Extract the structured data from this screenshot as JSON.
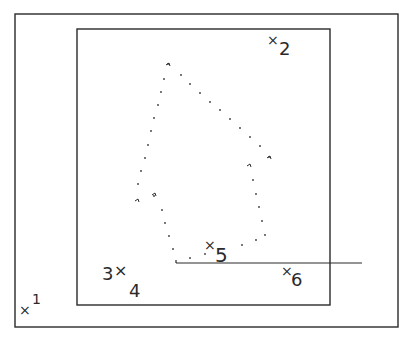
{
  "diagram": {
    "type": "cad-viewport-selection",
    "colors": {
      "line": "#2a2a2a",
      "background": "#ffffff",
      "dots": "#3a3a3a"
    },
    "outer_frame": {
      "x1": 15,
      "y1": 14,
      "x2": 398,
      "y2": 327
    },
    "inner_frame": {
      "x1": 77,
      "y1": 29,
      "x2": 330,
      "y2": 305
    },
    "horizontal_line": {
      "x1": 176,
      "y1": 263,
      "x2": 362,
      "y2": 263
    },
    "points": [
      {
        "id": "1",
        "label": "1",
        "marker": "×",
        "x": 25,
        "y": 310
      },
      {
        "id": "2",
        "label": "2",
        "marker": "×",
        "x": 274,
        "y": 41
      },
      {
        "id": "3",
        "label": "3",
        "marker": "×",
        "x": 120,
        "y": 272
      },
      {
        "id": "4",
        "label": "4",
        "marker": "",
        "x": 137,
        "y": 292
      },
      {
        "id": "5",
        "label": "5",
        "marker": "×",
        "x": 210,
        "y": 246
      },
      {
        "id": "6",
        "label": "6",
        "marker": "×",
        "x": 287,
        "y": 272
      }
    ],
    "dotted_polygon": [
      [
        168,
        64
      ],
      [
        181,
        75
      ],
      [
        190,
        84
      ],
      [
        200,
        93
      ],
      [
        210,
        102
      ],
      [
        220,
        110
      ],
      [
        230,
        119
      ],
      [
        240,
        128
      ],
      [
        250,
        137
      ],
      [
        260,
        146
      ],
      [
        269,
        157
      ],
      [
        164,
        79
      ],
      [
        161,
        92
      ],
      [
        158,
        105
      ],
      [
        154,
        118
      ],
      [
        151,
        131
      ],
      [
        148,
        145
      ],
      [
        145,
        158
      ],
      [
        141,
        171
      ],
      [
        138,
        184
      ],
      [
        154,
        196
      ],
      [
        162,
        210
      ],
      [
        165,
        223
      ],
      [
        169,
        236
      ],
      [
        173,
        249
      ],
      [
        253,
        180
      ],
      [
        256,
        194
      ],
      [
        259,
        207
      ],
      [
        262,
        221
      ],
      [
        265,
        235
      ],
      [
        256,
        240
      ],
      [
        242,
        245
      ],
      [
        205,
        254
      ],
      [
        190,
        258
      ]
    ],
    "corner_ticks": [
      {
        "x": 168,
        "y": 64
      },
      {
        "x": 137,
        "y": 200
      },
      {
        "x": 154,
        "y": 194
      },
      {
        "x": 269,
        "y": 157
      },
      {
        "x": 249,
        "y": 165
      }
    ],
    "caption": ""
  }
}
